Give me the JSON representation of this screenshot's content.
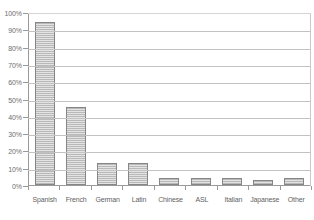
{
  "chart_data": {
    "type": "bar",
    "title": "",
    "subtitle": "",
    "xlabel": "",
    "ylabel": "",
    "categories": [
      "Spanish",
      "French",
      "German",
      "Latin",
      "Chinese",
      "ASL",
      "Italian",
      "Japanese",
      "Other"
    ],
    "values": [
      94,
      45,
      13,
      13,
      4,
      4,
      4,
      3,
      4
    ],
    "ylim": [
      0,
      100
    ],
    "ytick_labels": [
      "100%",
      "90%",
      "80%",
      "70%",
      "60%",
      "50%",
      "40%",
      "30%",
      "20%",
      "10%",
      "0%"
    ],
    "ytick_values": [
      100,
      90,
      80,
      70,
      60,
      50,
      40,
      30,
      20,
      10,
      0
    ],
    "grid": true,
    "legend": false,
    "legend_position": "none",
    "colors": {
      "bar_fill": "#d2d2d2",
      "bar_stripe": "#b9b9b9",
      "bar_border": "#868686",
      "gridline": "#c2c2c2",
      "axis": "#9a9a9a",
      "label_text": "#5f5f5f",
      "background": "#ffffff"
    }
  }
}
